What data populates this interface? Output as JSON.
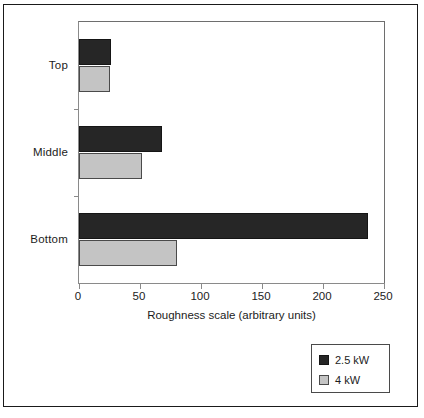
{
  "chart_data": {
    "type": "bar",
    "orientation": "horizontal",
    "title": "",
    "xlabel": "Roughness scale (arbitrary units)",
    "ylabel": "",
    "categories": [
      "Top",
      "Middle",
      "Bottom"
    ],
    "series": [
      {
        "name": "2.5 kW",
        "color": "#262626",
        "values": [
          26,
          68,
          237
        ]
      },
      {
        "name": "4 kW",
        "color": "#c4c4c4",
        "values": [
          25,
          52,
          80
        ]
      }
    ],
    "xlim": [
      0,
      250
    ],
    "xticks": [
      0,
      50,
      100,
      150,
      200,
      250
    ],
    "xticklabels": [
      "0",
      "50",
      "100",
      "150",
      "200",
      "250"
    ],
    "grid": false,
    "legend_position": "outside-bottom-right"
  },
  "legend": {
    "entries": [
      {
        "label": "2.5 kW",
        "swatch": "dark"
      },
      {
        "label": "4 kW",
        "swatch": "light"
      }
    ]
  }
}
